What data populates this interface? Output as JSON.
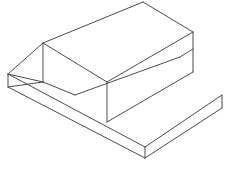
{
  "drawing": {
    "title": "Isometric pictorial of stepped block with triangular V-ridge",
    "type": "isometric-line-drawing",
    "projection": "isometric",
    "canvas": {
      "width": 231,
      "height": 173
    },
    "style": {
      "background_color": "#ffffff",
      "line_color": "#4b4b52",
      "face_fill": "#ffffff",
      "line_width": 1
    },
    "vertices": {
      "base_left": "8,87",
      "base_left_top": "8,74",
      "base_bottom": "145,147",
      "base_bottom_low": "145,158",
      "base_right": "222,95",
      "base_right_low": "222,108",
      "step_inner_top": "107,82",
      "step_inner_bottom": "107,122",
      "step_top_right": "193,32",
      "step_right_bottom": "193,72",
      "prism_apex_left": "43,43",
      "prism_apex_right": "143,2",
      "prism_base_left_front": "43,82",
      "prism_valley_front": "75,95",
      "prism_ridge_far": "180,57",
      "tri_left_vertex": "8,74",
      "tri_right_vertex": "75,95"
    },
    "faces": [
      {
        "name": "base-top-left-plate",
        "role": "horizontal top surface of lower slab"
      },
      {
        "name": "base-front-left-face",
        "role": "vertical left front face of base slab"
      },
      {
        "name": "base-front-right-face",
        "role": "vertical right front face of base slab"
      },
      {
        "name": "step-top-surface",
        "role": "horizontal top surface of raised step"
      },
      {
        "name": "step-front-face",
        "role": "vertical front riser of raised step"
      },
      {
        "name": "step-right-end-face",
        "role": "vertical right end face of raised step"
      },
      {
        "name": "prism-near-slope",
        "role": "inclined near face of triangular ridge"
      },
      {
        "name": "prism-far-slope",
        "role": "inclined far face of triangular ridge"
      },
      {
        "name": "prism-end-triangle",
        "role": "triangular left end face of ridge"
      },
      {
        "name": "prism-right-end-face",
        "role": "right end face of ridge above step"
      }
    ],
    "edges": [
      {
        "name": "base-left-vertical",
        "from": "8,74",
        "to": "8,87"
      },
      {
        "name": "base-bottom-vertical",
        "from": "145,147",
        "to": "145,158"
      },
      {
        "name": "base-right-vertical",
        "from": "222,95",
        "to": "222,108"
      },
      {
        "name": "base-front-left-lower",
        "from": "8,87",
        "to": "145,158"
      },
      {
        "name": "base-front-right-lower",
        "from": "145,158",
        "to": "222,108"
      },
      {
        "name": "base-top-left-receding",
        "from": "8,74",
        "to": "145,147"
      },
      {
        "name": "base-top-right-receding",
        "from": "145,147",
        "to": "222,95"
      },
      {
        "name": "step-inner-vertical",
        "from": "107,82",
        "to": "107,122"
      },
      {
        "name": "step-right-vertical",
        "from": "193,32",
        "to": "193,72"
      },
      {
        "name": "step-front-lower-edge",
        "from": "107,122",
        "to": "193,72"
      },
      {
        "name": "step-top-front-edge",
        "from": "107,82",
        "to": "193,32"
      },
      {
        "name": "step-top-back-left",
        "from": "43,43",
        "to": "107,82"
      },
      {
        "name": "prism-ridge-line",
        "from": "43,43",
        "to": "143,2"
      },
      {
        "name": "prism-apex-vertical",
        "from": "43,43",
        "to": "43,82"
      },
      {
        "name": "prism-near-slope-left",
        "from": "43,82",
        "to": "75,95"
      },
      {
        "name": "prism-valley-line",
        "from": "75,95",
        "to": "180,57"
      },
      {
        "name": "prism-tri-upper-left",
        "from": "8,74",
        "to": "43,43"
      },
      {
        "name": "prism-tri-lower-left",
        "from": "8,74",
        "to": "43,82"
      },
      {
        "name": "prism-far-slope-right",
        "from": "143,2",
        "to": "193,32"
      },
      {
        "name": "prism-right-lower",
        "from": "180,57",
        "to": "193,49"
      }
    ]
  }
}
